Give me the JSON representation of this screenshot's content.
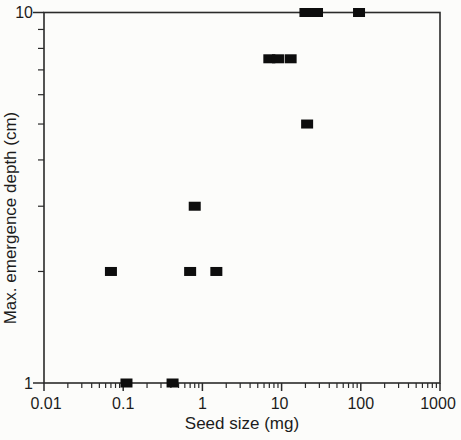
{
  "figure": {
    "background_color": "#fcfcfa",
    "axis_color": "#2a2a2a",
    "marker_color": "#0d0d0d",
    "text_color": "#1c1c1c",
    "marker_shape": "filled-square"
  },
  "chart_data": {
    "type": "scatter",
    "title": "",
    "xlabel": "Seed size (mg)",
    "ylabel": "Max. emergence depth (cm)",
    "x_scale": "log",
    "y_scale": "log",
    "xlim": [
      0.01,
      1000
    ],
    "ylim": [
      1,
      10
    ],
    "grid": false,
    "legend": null,
    "x_tick_labels": [
      "0.01",
      "0.1",
      "1",
      "10",
      "100",
      "1000"
    ],
    "x_tick_values": [
      0.01,
      0.1,
      1,
      10,
      100,
      1000
    ],
    "y_tick_labels": [
      "1",
      "10"
    ],
    "y_tick_values": [
      1,
      10
    ],
    "points": [
      {
        "x": 0.07,
        "y": 2
      },
      {
        "x": 0.11,
        "y": 1
      },
      {
        "x": 0.42,
        "y": 1
      },
      {
        "x": 0.7,
        "y": 2
      },
      {
        "x": 0.8,
        "y": 3
      },
      {
        "x": 1.5,
        "y": 2
      },
      {
        "x": 7,
        "y": 7.5
      },
      {
        "x": 9,
        "y": 7.5
      },
      {
        "x": 13,
        "y": 7.5
      },
      {
        "x": 21,
        "y": 5
      },
      {
        "x": 20,
        "y": 10
      },
      {
        "x": 28,
        "y": 10
      },
      {
        "x": 95,
        "y": 10
      }
    ]
  }
}
